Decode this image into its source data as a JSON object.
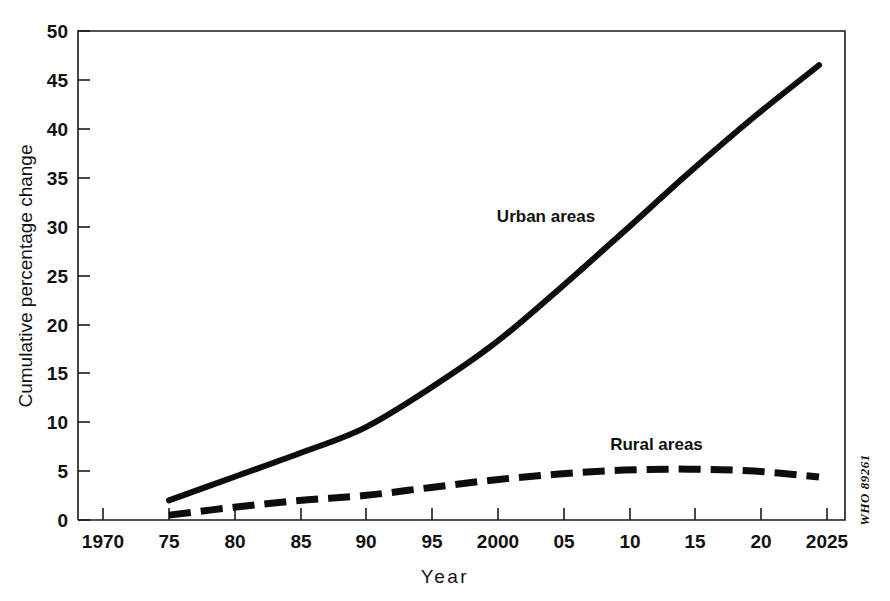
{
  "chart_data": {
    "type": "line",
    "title": "",
    "xlabel": "Year",
    "ylabel": "Cumulative percentage change",
    "xlim": [
      1968,
      2027
    ],
    "ylim": [
      0,
      50
    ],
    "grid": false,
    "legend_position": "inline-annotation",
    "x_tick_labels": [
      "1970",
      "75",
      "80",
      "85",
      "90",
      "95",
      "2000",
      "05",
      "10",
      "15",
      "20",
      "2025"
    ],
    "x_tick_values": [
      1970,
      1975,
      1980,
      1985,
      1990,
      1995,
      2000,
      2005,
      2010,
      2015,
      2020,
      2025
    ],
    "y_tick_labels": [
      "0",
      "5",
      "10",
      "15",
      "20",
      "25",
      "30",
      "35",
      "40",
      "45",
      "50"
    ],
    "y_tick_values": [
      0,
      5,
      10,
      15,
      20,
      25,
      30,
      35,
      40,
      45,
      50
    ],
    "x": [
      1975,
      1980,
      1985,
      1990,
      1995,
      2000,
      2005,
      2010,
      2015,
      2020,
      2025
    ],
    "series": [
      {
        "name": "Urban areas",
        "style": "solid",
        "values": [
          2.0,
          4.4,
          6.8,
          9.4,
          13.4,
          18.0,
          23.6,
          29.5,
          35.5,
          41.2,
          46.5
        ]
      },
      {
        "name": "Rural areas",
        "style": "dashed",
        "values": [
          0.5,
          1.3,
          2.0,
          2.5,
          3.3,
          4.1,
          4.7,
          5.1,
          5.2,
          5.0,
          4.4
        ]
      }
    ],
    "annotations": [
      {
        "text": "Urban areas",
        "x": 2004,
        "y": 30.5
      },
      {
        "text": "Rural areas",
        "x": 2012.5,
        "y": 7.2
      }
    ],
    "credit": "WHO  89261"
  }
}
